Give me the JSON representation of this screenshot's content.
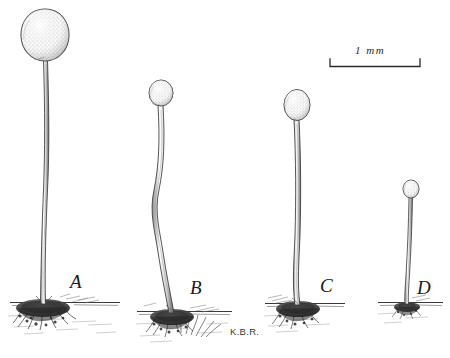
{
  "plate": {
    "title": "Sporangia of four specimens",
    "background_color": "#ffffff",
    "ink_color": "#2b2b2b",
    "width": 450,
    "height": 358
  },
  "scale_bar": {
    "label": "1 mm",
    "x_start": 330,
    "x_end": 420,
    "y": 66,
    "tick_height": 7,
    "label_x": 355,
    "label_y": 50
  },
  "signature": {
    "text": "K.B.R.",
    "x": 230,
    "y": 328
  },
  "specimens": [
    {
      "id": "A",
      "label": "A",
      "label_x": 70,
      "label_y": 274,
      "head": {
        "cx": 45,
        "cy": 35,
        "rx": 23,
        "ry": 26,
        "shape": "teardrop"
      },
      "stalk": {
        "top_x": 46,
        "top_y": 61,
        "base_x": 43,
        "base_y": 303,
        "waviness": "slight"
      },
      "ground": {
        "x_start": 10,
        "x_end": 120,
        "y": 303
      },
      "holdfast": {
        "cx": 43,
        "cy": 308,
        "rx": 27,
        "ry": 9
      },
      "height_mm": 2.6,
      "head_diameter_mm": 0.5
    },
    {
      "id": "B",
      "label": "B",
      "label_x": 190,
      "label_y": 280,
      "head": {
        "cx": 161,
        "cy": 93,
        "rx": 12,
        "ry": 13,
        "shape": "round"
      },
      "stalk": {
        "top_x": 161,
        "top_y": 106,
        "base_x": 172,
        "base_y": 312,
        "waviness": "strong"
      },
      "ground": {
        "x_start": 137,
        "x_end": 232,
        "y": 312
      },
      "holdfast": {
        "cx": 172,
        "cy": 317,
        "rx": 22,
        "ry": 8
      },
      "height_mm": 2.2,
      "head_diameter_mm": 0.27
    },
    {
      "id": "C",
      "label": "C",
      "label_x": 320,
      "label_y": 278,
      "head": {
        "cx": 297,
        "cy": 105,
        "rx": 13,
        "ry": 15,
        "shape": "oval"
      },
      "stalk": {
        "top_x": 297,
        "top_y": 120,
        "base_x": 298,
        "base_y": 304,
        "waviness": "slight"
      },
      "ground": {
        "x_start": 265,
        "x_end": 345,
        "y": 304
      },
      "holdfast": {
        "cx": 298,
        "cy": 309,
        "rx": 22,
        "ry": 8
      },
      "height_mm": 2.0,
      "head_diameter_mm": 0.29
    },
    {
      "id": "D",
      "label": "D",
      "label_x": 418,
      "label_y": 280,
      "head": {
        "cx": 411,
        "cy": 189,
        "rx": 8,
        "ry": 9,
        "shape": "round"
      },
      "stalk": {
        "top_x": 411,
        "top_y": 198,
        "base_x": 407,
        "base_y": 303,
        "waviness": "none"
      },
      "ground": {
        "x_start": 378,
        "x_end": 443,
        "y": 303
      },
      "holdfast": {
        "cx": 407,
        "cy": 307,
        "rx": 13,
        "ry": 5
      },
      "height_mm": 1.2,
      "head_diameter_mm": 0.18
    }
  ]
}
